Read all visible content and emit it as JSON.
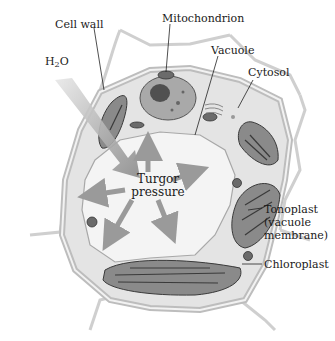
{
  "diagram": {
    "labels": {
      "cell_wall": "Cell wall",
      "mitochondrion": "Mitochondrion",
      "h2o_prefix": "H",
      "h2o_sub": "2",
      "h2o_suffix": "O",
      "vacuole": "Vacuole",
      "cytosol": "Cytosol",
      "turgor_line1": "Turgor",
      "turgor_line2": "pressure",
      "tonoplast_line1": "Tonoplast",
      "tonoplast_line2": "(vacuole",
      "tonoplast_line3": "membrane)",
      "chloroplast": "Chloroplast"
    },
    "colors": {
      "cell_wall": "#d6d6d6",
      "cytosol": "#e6e6e6",
      "vacuole": "#f3f3f3",
      "chloroplast": "#7e7e7e",
      "arrow": "#9a9a9a",
      "leader_line": "#222222"
    }
  }
}
